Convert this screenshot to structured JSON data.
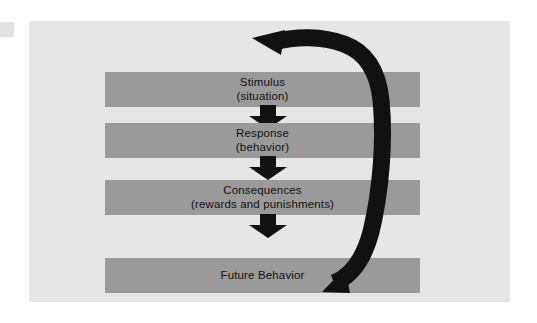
{
  "figure": {
    "background_color": "#ffffff",
    "panel_color": "#e6e6e6",
    "band_color": "#9a9a9a",
    "arrow_color": "#111111",
    "text_color": "#111111"
  },
  "flow": {
    "steps": [
      {
        "label": "Stimulus",
        "sublabel": "(situation)"
      },
      {
        "label": "Response",
        "sublabel": "(behavior)"
      },
      {
        "label": "Consequences",
        "sublabel": "(rewards and punishments)"
      },
      {
        "label": "Future Behavior",
        "sublabel": ""
      }
    ],
    "connectors": [
      {
        "name": "stimulus-to-response",
        "direction": "down"
      },
      {
        "name": "response-to-consequences",
        "direction": "down"
      },
      {
        "name": "consequences-to-future",
        "direction": "down"
      }
    ],
    "feedback": {
      "name": "future-behavior-to-stimulus",
      "direction": "curved-up-left",
      "from": "Future Behavior",
      "to": "Stimulus"
    }
  }
}
